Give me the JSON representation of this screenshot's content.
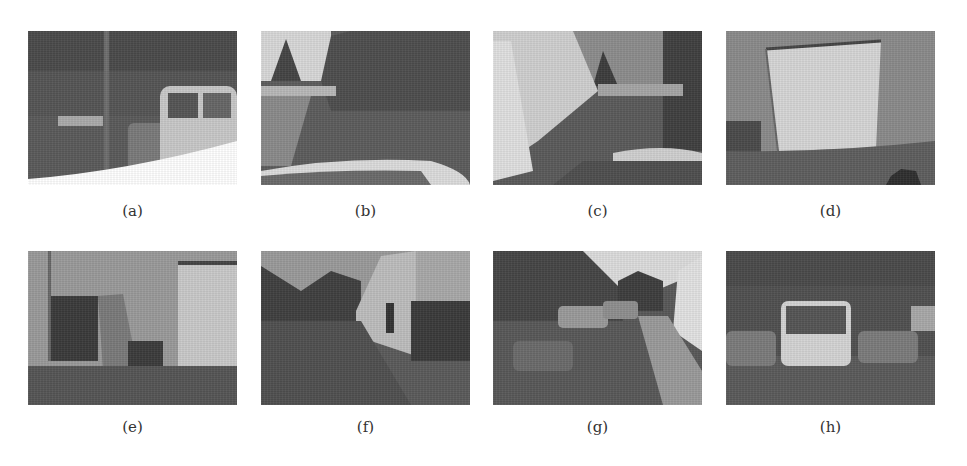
{
  "figure": {
    "panels": [
      {
        "id": "a",
        "caption": "(a)",
        "description": "Fisheye view of carport with parked cars, white van on right"
      },
      {
        "id": "b",
        "caption": "(b)",
        "description": "Road view past garage buildings with trees, car hood at bottom"
      },
      {
        "id": "c",
        "caption": "(c)",
        "description": "White wall on left, driveway leading to trees, car hood at bottom"
      },
      {
        "id": "d",
        "caption": "(d)",
        "description": "Close view of white garage door panel"
      },
      {
        "id": "e",
        "caption": "(e)",
        "description": "Building corner with dark doorway and chair"
      },
      {
        "id": "f",
        "caption": "(f)",
        "description": "Alley between building and trees, wall on right"
      },
      {
        "id": "g",
        "caption": "(g)",
        "description": "Parked cars under carport with road and white wall on right"
      },
      {
        "id": "h",
        "caption": "(h)",
        "description": "Rear of white van parked between two cars under carport"
      }
    ]
  }
}
